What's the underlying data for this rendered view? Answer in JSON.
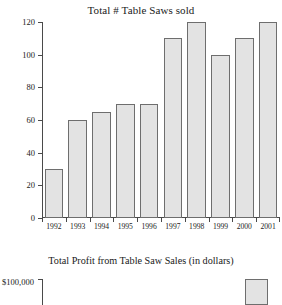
{
  "chart_data": [
    {
      "id": "table-saws-sold",
      "type": "bar",
      "title": "Total # Table Saws sold",
      "xlabel": "",
      "ylabel": "",
      "categories": [
        "1992",
        "1993",
        "1994",
        "1995",
        "1996",
        "1997",
        "1998",
        "1999",
        "2000",
        "2001"
      ],
      "values": [
        30,
        60,
        65,
        70,
        70,
        110,
        120,
        100,
        110,
        120
      ],
      "ylim": [
        0,
        120
      ],
      "yticks": [
        0,
        20,
        40,
        60,
        80,
        100,
        120
      ],
      "ytick_labels": [
        "0",
        "20",
        "40",
        "60",
        "80",
        "100",
        "120"
      ],
      "grid": false,
      "legend": null,
      "bar_fill": "#e3e3e3",
      "bar_border": "#6e6e6e"
    },
    {
      "id": "table-saw-profit",
      "type": "bar",
      "title": "Total Profit from Table Saw Sales (in dollars)",
      "xlabel": "",
      "ylabel": "",
      "categories": [
        "2001"
      ],
      "values": [
        100000
      ],
      "ylim": [
        0,
        100000
      ],
      "yticks": [
        100000
      ],
      "ytick_labels": [
        "$100,000"
      ],
      "grid": false,
      "legend": null,
      "note": "chart is cut off at the bottom edge of the screenshot; only the top of the axis and the tallest right-hand bar are visible",
      "bar_fill": "#e3e3e3",
      "bar_border": "#6e6e6e"
    }
  ]
}
